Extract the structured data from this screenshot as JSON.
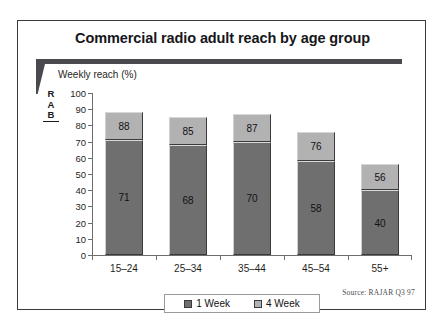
{
  "panel": {
    "title": "Commercial radio adult reach by age group",
    "logo": {
      "line1": "R",
      "line2": "A",
      "line3": "B"
    },
    "axis_caption": "Weekly reach (%)",
    "source": "Source: RAJAR Q3 97"
  },
  "legend": {
    "entries": [
      {
        "label": "1 Week",
        "color": "#6f6f6f"
      },
      {
        "label": "4 Week",
        "color": "#b2b2b2"
      }
    ]
  },
  "chart_data": {
    "type": "bar",
    "subtype": "stacked-overlay",
    "title": "Commercial radio adult reach by age group",
    "xlabel": "",
    "ylabel": "Weekly reach (%)",
    "ylim": [
      0,
      100
    ],
    "yticks": [
      0,
      10,
      20,
      30,
      40,
      50,
      60,
      70,
      80,
      90,
      100
    ],
    "grid": false,
    "legend_position": "bottom",
    "categories": [
      "15–24",
      "25–34",
      "35–44",
      "45–54",
      "55+"
    ],
    "series": [
      {
        "name": "1 Week",
        "color": "#6f6f6f",
        "values": [
          71,
          68,
          70,
          58,
          40
        ]
      },
      {
        "name": "4 Week",
        "color": "#b2b2b2",
        "values": [
          88,
          85,
          87,
          76,
          56
        ]
      }
    ],
    "annotation": "Source: RAJAR Q3 97"
  }
}
